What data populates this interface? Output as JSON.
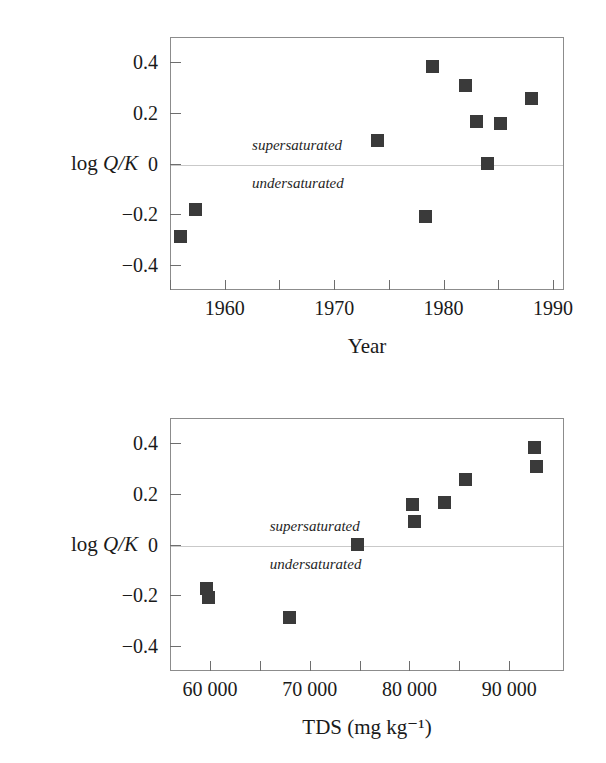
{
  "figure": {
    "ylabel_roman": "log ",
    "ylabel_italic": "Q/K",
    "note_super": "supersaturated",
    "note_under": "undersaturated",
    "marker_color": "#3a3a3a",
    "axis_color": "#8c8c8c",
    "zeroline_color": "#c9c9c9"
  },
  "chart_data": [
    {
      "type": "scatter",
      "title": "",
      "xlabel": "Year",
      "ylabel": "log Q/K",
      "xlim": [
        1955,
        1991
      ],
      "ylim": [
        -0.5,
        0.5
      ],
      "grid": false,
      "legend": "none",
      "xticks": [
        1955,
        1960,
        1965,
        1970,
        1975,
        1980,
        1985,
        1990
      ],
      "xticklabels": [
        {
          "value": 1960,
          "label": "1960"
        },
        {
          "value": 1970,
          "label": "1970"
        },
        {
          "value": 1980,
          "label": "1980"
        },
        {
          "value": 1990,
          "label": "1990"
        }
      ],
      "yticks": [
        -0.4,
        -0.2,
        0,
        0.2,
        0.4
      ],
      "yticklabels": [
        "−0.4",
        "−0.2",
        "0",
        "0.2",
        "0.4"
      ],
      "annotations": [
        {
          "text": "supersaturated",
          "x": 1962.5,
          "y": 0.07
        },
        {
          "text": "undersaturated",
          "x": 1962.5,
          "y": -0.08
        }
      ],
      "reference_line": {
        "y": 0,
        "style": "solid-light"
      },
      "x": [
        1956.0,
        1957.3,
        1974.0,
        1978.3,
        1979.0,
        1982.0,
        1983.0,
        1984.0,
        1985.2,
        1988.0
      ],
      "y": [
        -0.29,
        -0.18,
        0.09,
        -0.21,
        0.385,
        0.31,
        0.165,
        0.0,
        0.16,
        0.255
      ]
    },
    {
      "type": "scatter",
      "title": "",
      "xlabel": "TDS (mg kg⁻¹)",
      "ylabel": "log Q/K",
      "xlim": [
        56000,
        95500
      ],
      "ylim": [
        -0.5,
        0.5
      ],
      "grid": false,
      "legend": "none",
      "xticks": [
        60000,
        65000,
        70000,
        75000,
        80000,
        85000,
        90000
      ],
      "xticklabels": [
        {
          "value": 60000,
          "label": "60 000"
        },
        {
          "value": 70000,
          "label": "70 000"
        },
        {
          "value": 80000,
          "label": "80 000"
        },
        {
          "value": 90000,
          "label": "90 000"
        }
      ],
      "yticks": [
        -0.4,
        -0.2,
        0,
        0.2,
        0.4
      ],
      "yticklabels": [
        "−0.4",
        "−0.2",
        "0",
        "0.2",
        "0.4"
      ],
      "annotations": [
        {
          "text": "supersaturated",
          "x": 66000,
          "y": 0.07
        },
        {
          "text": "undersaturated",
          "x": 66000,
          "y": -0.08
        }
      ],
      "reference_line": {
        "y": 0,
        "style": "solid-light"
      },
      "x": [
        59700,
        59900,
        68000,
        74800,
        80300,
        80500,
        83500,
        85600,
        92500,
        92700
      ],
      "y": [
        -0.175,
        -0.21,
        -0.29,
        0.0,
        0.16,
        0.09,
        0.165,
        0.255,
        0.385,
        0.31
      ]
    }
  ]
}
